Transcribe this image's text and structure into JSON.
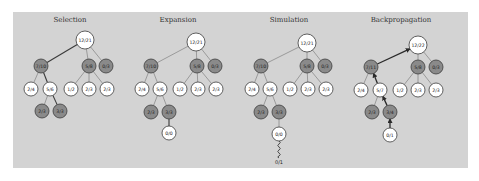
{
  "diagram": {
    "colors": {
      "background": "#ffffff",
      "panel": "#d3d3d3",
      "node_white": "#ffffff",
      "node_dark": "#8a8a8a",
      "edge": "#8c8c8c",
      "edge_highlight": "#2a2a2a"
    },
    "panel": {
      "x": 13,
      "y": 12,
      "width": 455,
      "height": 156
    },
    "phases": [
      {
        "title": "Selection",
        "title_pos": [
          70,
          22
        ],
        "nodes": [
          {
            "id": "root",
            "label": "12/21",
            "x": 85,
            "y": 40,
            "r": 9,
            "dark": false
          },
          {
            "id": "a",
            "label": "7/10",
            "x": 41,
            "y": 66,
            "r": 7,
            "dark": true
          },
          {
            "id": "b",
            "label": "5/8",
            "x": 89,
            "y": 66,
            "r": 7,
            "dark": true
          },
          {
            "id": "c",
            "label": "0/3",
            "x": 106,
            "y": 66,
            "r": 7,
            "dark": true
          },
          {
            "id": "a1",
            "label": "2/4",
            "x": 31,
            "y": 89,
            "r": 7,
            "dark": false
          },
          {
            "id": "a2",
            "label": "5/6",
            "x": 50,
            "y": 89,
            "r": 7,
            "dark": false
          },
          {
            "id": "b1",
            "label": "1/2",
            "x": 71,
            "y": 89,
            "r": 7,
            "dark": false
          },
          {
            "id": "b2",
            "label": "2/3",
            "x": 89,
            "y": 89,
            "r": 7,
            "dark": false
          },
          {
            "id": "b3",
            "label": "2/3",
            "x": 107,
            "y": 89,
            "r": 7,
            "dark": false
          },
          {
            "id": "a21",
            "label": "2/3",
            "x": 42,
            "y": 111,
            "r": 7,
            "dark": true
          },
          {
            "id": "a22",
            "label": "3/3",
            "x": 60,
            "y": 111,
            "r": 7,
            "dark": true
          }
        ],
        "edges": [
          {
            "from": "root",
            "to": "a",
            "style": "path"
          },
          {
            "from": "root",
            "to": "b",
            "style": "normal"
          },
          {
            "from": "root",
            "to": "c",
            "style": "normal"
          },
          {
            "from": "a",
            "to": "a1",
            "style": "normal"
          },
          {
            "from": "a",
            "to": "a2",
            "style": "path"
          },
          {
            "from": "b",
            "to": "b1",
            "style": "normal"
          },
          {
            "from": "b",
            "to": "b2",
            "style": "normal"
          },
          {
            "from": "b",
            "to": "b3",
            "style": "normal"
          },
          {
            "from": "a2",
            "to": "a21",
            "style": "normal"
          },
          {
            "from": "a2",
            "to": "a22",
            "style": "path"
          }
        ]
      },
      {
        "title": "Expansion",
        "title_pos": [
          178,
          22
        ],
        "nodes": [
          {
            "id": "root",
            "label": "12/21",
            "x": 196,
            "y": 42,
            "r": 9,
            "dark": false
          },
          {
            "id": "a",
            "label": "7/10",
            "x": 151,
            "y": 66,
            "r": 7,
            "dark": true
          },
          {
            "id": "b",
            "label": "5/8",
            "x": 197,
            "y": 66,
            "r": 7,
            "dark": true
          },
          {
            "id": "c",
            "label": "0/3",
            "x": 215,
            "y": 66,
            "r": 7,
            "dark": true
          },
          {
            "id": "a1",
            "label": "2/4",
            "x": 142,
            "y": 89,
            "r": 7,
            "dark": false
          },
          {
            "id": "a2",
            "label": "5/6",
            "x": 160,
            "y": 89,
            "r": 7,
            "dark": false
          },
          {
            "id": "b1",
            "label": "1/2",
            "x": 180,
            "y": 89,
            "r": 7,
            "dark": false
          },
          {
            "id": "b2",
            "label": "2/3",
            "x": 198,
            "y": 89,
            "r": 7,
            "dark": false
          },
          {
            "id": "b3",
            "label": "2/3",
            "x": 216,
            "y": 89,
            "r": 7,
            "dark": false
          },
          {
            "id": "a21",
            "label": "2/3",
            "x": 151,
            "y": 112,
            "r": 7,
            "dark": true
          },
          {
            "id": "a22",
            "label": "3/3",
            "x": 169,
            "y": 112,
            "r": 7,
            "dark": true
          },
          {
            "id": "new",
            "label": "0/0",
            "x": 169,
            "y": 133,
            "r": 7,
            "dark": false
          }
        ],
        "edges": [
          {
            "from": "root",
            "to": "a",
            "style": "normal"
          },
          {
            "from": "root",
            "to": "b",
            "style": "normal"
          },
          {
            "from": "root",
            "to": "c",
            "style": "normal"
          },
          {
            "from": "a",
            "to": "a1",
            "style": "normal"
          },
          {
            "from": "a",
            "to": "a2",
            "style": "normal"
          },
          {
            "from": "b",
            "to": "b1",
            "style": "normal"
          },
          {
            "from": "b",
            "to": "b2",
            "style": "normal"
          },
          {
            "from": "b",
            "to": "b3",
            "style": "normal"
          },
          {
            "from": "a2",
            "to": "a21",
            "style": "normal"
          },
          {
            "from": "a2",
            "to": "a22",
            "style": "normal"
          },
          {
            "from": "a22",
            "to": "new",
            "style": "path"
          }
        ]
      },
      {
        "title": "Simulation",
        "title_pos": [
          289,
          22
        ],
        "nodes": [
          {
            "id": "root",
            "label": "12/21",
            "x": 307,
            "y": 43,
            "r": 9,
            "dark": false
          },
          {
            "id": "a",
            "label": "7/10",
            "x": 261,
            "y": 66,
            "r": 7,
            "dark": true
          },
          {
            "id": "b",
            "label": "5/8",
            "x": 307,
            "y": 66,
            "r": 7,
            "dark": true
          },
          {
            "id": "c",
            "label": "0/3",
            "x": 325,
            "y": 66,
            "r": 7,
            "dark": true
          },
          {
            "id": "a1",
            "label": "2/4",
            "x": 252,
            "y": 89,
            "r": 7,
            "dark": false
          },
          {
            "id": "a2",
            "label": "5/6",
            "x": 270,
            "y": 89,
            "r": 7,
            "dark": false
          },
          {
            "id": "b1",
            "label": "1/2",
            "x": 290,
            "y": 89,
            "r": 7,
            "dark": false
          },
          {
            "id": "b2",
            "label": "2/3",
            "x": 308,
            "y": 89,
            "r": 7,
            "dark": false
          },
          {
            "id": "b3",
            "label": "2/3",
            "x": 326,
            "y": 89,
            "r": 7,
            "dark": false
          },
          {
            "id": "a21",
            "label": "2/3",
            "x": 261,
            "y": 112,
            "r": 7,
            "dark": true
          },
          {
            "id": "a22",
            "label": "3/3",
            "x": 279,
            "y": 112,
            "r": 7,
            "dark": true
          },
          {
            "id": "new",
            "label": "0/0",
            "x": 279,
            "y": 134,
            "r": 7,
            "dark": false
          }
        ],
        "edges": [
          {
            "from": "root",
            "to": "a",
            "style": "normal"
          },
          {
            "from": "root",
            "to": "b",
            "style": "normal"
          },
          {
            "from": "root",
            "to": "c",
            "style": "normal"
          },
          {
            "from": "a",
            "to": "a1",
            "style": "normal"
          },
          {
            "from": "a",
            "to": "a2",
            "style": "normal"
          },
          {
            "from": "b",
            "to": "b1",
            "style": "normal"
          },
          {
            "from": "b",
            "to": "b2",
            "style": "normal"
          },
          {
            "from": "b",
            "to": "b3",
            "style": "normal"
          },
          {
            "from": "a2",
            "to": "a21",
            "style": "normal"
          },
          {
            "from": "a2",
            "to": "a22",
            "style": "normal"
          },
          {
            "from": "a22",
            "to": "new",
            "style": "normal"
          }
        ],
        "rollout": {
          "from": "new",
          "x": 279,
          "y_end": 158,
          "result_label": "0/1",
          "result_y": 164
        }
      },
      {
        "title": "Backpropagation",
        "title_pos": [
          401,
          22
        ],
        "nodes": [
          {
            "id": "root",
            "label": "12/22",
            "x": 418,
            "y": 45,
            "r": 9,
            "dark": false
          },
          {
            "id": "a",
            "label": "7/11",
            "x": 371,
            "y": 67,
            "r": 7,
            "dark": true
          },
          {
            "id": "b",
            "label": "5/8",
            "x": 418,
            "y": 67,
            "r": 7,
            "dark": true
          },
          {
            "id": "c",
            "label": "0/3",
            "x": 436,
            "y": 67,
            "r": 7,
            "dark": true
          },
          {
            "id": "a1",
            "label": "2/4",
            "x": 361,
            "y": 90,
            "r": 7,
            "dark": false
          },
          {
            "id": "a2",
            "label": "5/7",
            "x": 380,
            "y": 90,
            "r": 7,
            "dark": false
          },
          {
            "id": "b1",
            "label": "1/2",
            "x": 400,
            "y": 90,
            "r": 7,
            "dark": false
          },
          {
            "id": "b2",
            "label": "2/3",
            "x": 418,
            "y": 90,
            "r": 7,
            "dark": false
          },
          {
            "id": "b3",
            "label": "2/3",
            "x": 436,
            "y": 90,
            "r": 7,
            "dark": false
          },
          {
            "id": "a21",
            "label": "2/3",
            "x": 372,
            "y": 112,
            "r": 7,
            "dark": true
          },
          {
            "id": "a22",
            "label": "3/4",
            "x": 390,
            "y": 112,
            "r": 7,
            "dark": true
          },
          {
            "id": "new",
            "label": "0/1",
            "x": 390,
            "y": 135,
            "r": 7,
            "dark": false
          }
        ],
        "edges": [
          {
            "from": "a",
            "to": "root",
            "style": "back"
          },
          {
            "from": "root",
            "to": "b",
            "style": "normal"
          },
          {
            "from": "root",
            "to": "c",
            "style": "normal"
          },
          {
            "from": "a",
            "to": "a1",
            "style": "normal"
          },
          {
            "from": "a2",
            "to": "a",
            "style": "back"
          },
          {
            "from": "b",
            "to": "b1",
            "style": "normal"
          },
          {
            "from": "b",
            "to": "b2",
            "style": "normal"
          },
          {
            "from": "b",
            "to": "b3",
            "style": "normal"
          },
          {
            "from": "a2",
            "to": "a21",
            "style": "normal"
          },
          {
            "from": "a22",
            "to": "a2",
            "style": "back"
          },
          {
            "from": "new",
            "to": "a22",
            "style": "back"
          }
        ]
      }
    ]
  }
}
